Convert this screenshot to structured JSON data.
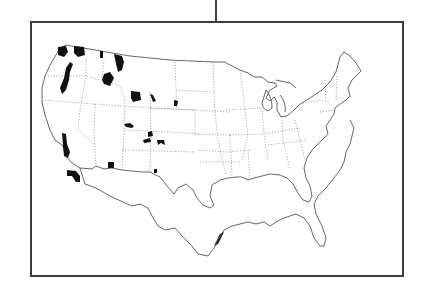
{
  "figure": {
    "title": "",
    "colors": {
      "frame": "#3c3c3c",
      "outline": "#555555",
      "state_borders": "#8a8a8a",
      "shaded_regions": "#111111",
      "background": "#ffffff"
    }
  },
  "map": {
    "region": "Contiguous United States",
    "shaded_areas": [
      {
        "state": "Washington",
        "location": "northwest Olympic peninsula"
      },
      {
        "state": "Washington",
        "location": "north Cascades"
      },
      {
        "state": "Washington",
        "location": "northeast"
      },
      {
        "state": "Oregon",
        "location": "Cascades"
      },
      {
        "state": "Idaho",
        "location": "panhandle"
      },
      {
        "state": "Montana",
        "location": "northwest"
      },
      {
        "state": "Idaho",
        "location": "central"
      },
      {
        "state": "Wyoming",
        "location": "northwest"
      },
      {
        "state": "Wyoming",
        "location": "north-central"
      },
      {
        "state": "South Dakota",
        "location": "Black Hills"
      },
      {
        "state": "Utah",
        "location": "north"
      },
      {
        "state": "Colorado",
        "location": "central"
      },
      {
        "state": "California",
        "location": "Sierra Nevada"
      },
      {
        "state": "California",
        "location": "southern"
      },
      {
        "state": "Arizona",
        "location": "northern"
      },
      {
        "state": "New Mexico",
        "location": "north-central"
      },
      {
        "state": "Texas",
        "location": "Gulf coast"
      }
    ]
  }
}
